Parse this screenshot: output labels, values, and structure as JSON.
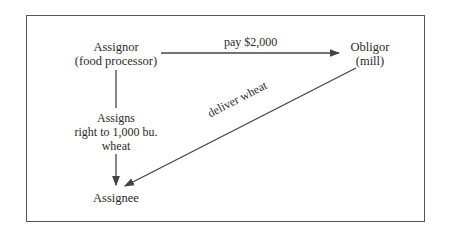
{
  "diagram": {
    "nodes": {
      "assignor": {
        "title": "Assignor",
        "subtitle": "(food processor)"
      },
      "obligor": {
        "title": "Obligor",
        "subtitle": "(mill)"
      },
      "assignee": {
        "title": "Assignee"
      }
    },
    "edges": {
      "pay": {
        "from": "assignor",
        "to": "obligor",
        "label": "pay $2,000"
      },
      "assigns": {
        "from": "assignor",
        "to": "assignee",
        "label_lines": [
          "Assigns",
          "right to 1,000 bu.",
          "wheat"
        ]
      },
      "deliver": {
        "from": "obligor",
        "to": "assignee",
        "label": "deliver wheat"
      }
    },
    "colors": {
      "line": "#444444",
      "text": "#2a2a2a",
      "border": "#555555"
    }
  }
}
